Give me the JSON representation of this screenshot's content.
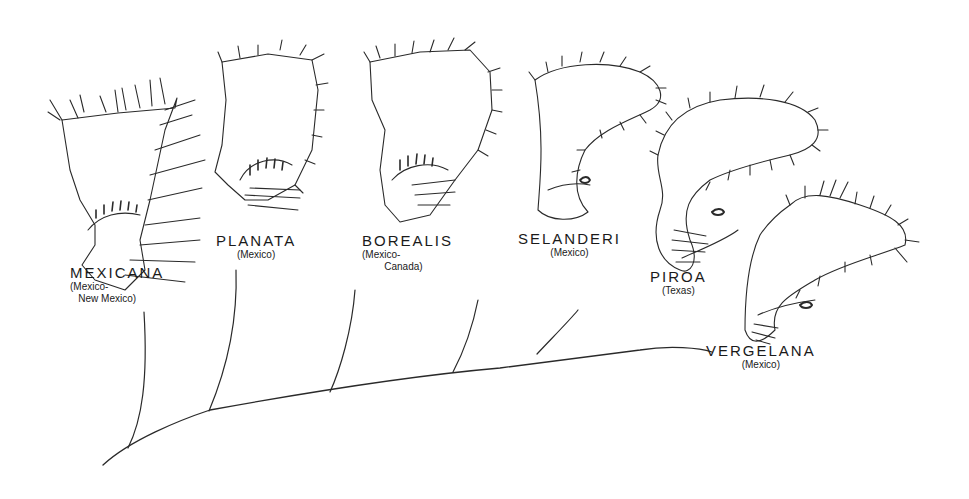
{
  "figure": {
    "type": "phylogenetic tree with illustrated specimens",
    "taxa": [
      {
        "name": "MEXICANA",
        "range": "(Mexico-\n   New Mexico)"
      },
      {
        "name": "PLANATA",
        "range": "(Mexico)"
      },
      {
        "name": "BOREALIS",
        "range": "(Mexico-\n        Canada)"
      },
      {
        "name": "SELANDERI",
        "range": "(Mexico)"
      },
      {
        "name": "PIROA",
        "range": "(Texas)"
      },
      {
        "name": "VERGELANA",
        "range": "(Mexico)"
      }
    ],
    "colors": {
      "ink": "#2a2a2a",
      "background": "#ffffff"
    }
  }
}
